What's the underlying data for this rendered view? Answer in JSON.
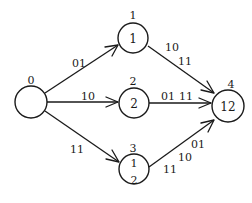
{
  "diagram": {
    "type": "directed-graph",
    "nodes": [
      {
        "id": "n0",
        "label_above": "0",
        "inner": []
      },
      {
        "id": "n1",
        "label_above": "1",
        "inner": [
          "1"
        ]
      },
      {
        "id": "n2",
        "label_above": "2",
        "inner": [
          "2"
        ]
      },
      {
        "id": "n3",
        "label_above": "3",
        "inner": [
          "1",
          "2"
        ]
      },
      {
        "id": "n4",
        "label_above": "4",
        "inner": [
          "12"
        ]
      }
    ],
    "edges": [
      {
        "from": "n0",
        "to": "n1",
        "labels": [
          "01"
        ]
      },
      {
        "from": "n0",
        "to": "n2",
        "labels": [
          "10"
        ]
      },
      {
        "from": "n0",
        "to": "n3",
        "labels": [
          "11"
        ]
      },
      {
        "from": "n1",
        "to": "n4",
        "labels": [
          "10",
          "11"
        ]
      },
      {
        "from": "n2",
        "to": "n4",
        "labels": [
          "01",
          "11"
        ]
      },
      {
        "from": "n3",
        "to": "n4",
        "labels": [
          "11",
          "10",
          "01"
        ]
      }
    ]
  }
}
